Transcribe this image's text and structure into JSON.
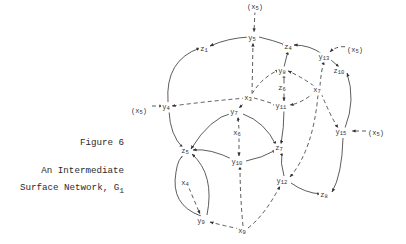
{
  "figure": {
    "number_label": "Figure 6",
    "title_line1": "An Intermediate",
    "title_line2_main": "Surface Network, G",
    "title_line2_sub": "1"
  },
  "nodes": [
    {
      "id": "x5_top",
      "base": "(x",
      "sub": "5",
      "suffix": ")",
      "x": 255,
      "y": 7
    },
    {
      "id": "y5",
      "base": "y",
      "sub": "5",
      "suffix": "",
      "x": 252,
      "y": 38
    },
    {
      "id": "z1",
      "base": "z",
      "sub": "1",
      "suffix": "",
      "x": 204,
      "y": 49
    },
    {
      "id": "z4",
      "base": "z",
      "sub": "4",
      "suffix": "",
      "x": 288,
      "y": 47
    },
    {
      "id": "y13",
      "base": "y",
      "sub": "13",
      "suffix": "",
      "x": 324,
      "y": 57
    },
    {
      "id": "x5_rt",
      "base": "(x",
      "sub": "5",
      "suffix": ")",
      "x": 355,
      "y": 50
    },
    {
      "id": "z10",
      "base": "z",
      "sub": "10",
      "suffix": "",
      "x": 339,
      "y": 71
    },
    {
      "id": "y8",
      "base": "y",
      "sub": "8",
      "suffix": "",
      "x": 282,
      "y": 71
    },
    {
      "id": "z6",
      "base": "z",
      "sub": "6",
      "suffix": "",
      "x": 282,
      "y": 88
    },
    {
      "id": "x7",
      "base": "x",
      "sub": "7",
      "suffix": "",
      "x": 317,
      "y": 90
    },
    {
      "id": "x3",
      "base": "x",
      "sub": "3",
      "suffix": "",
      "x": 248,
      "y": 98
    },
    {
      "id": "y11",
      "base": "y",
      "sub": "11",
      "suffix": "",
      "x": 281,
      "y": 106
    },
    {
      "id": "x5_left",
      "base": "(x",
      "sub": "5",
      "suffix": ")",
      "x": 139,
      "y": 111
    },
    {
      "id": "y4",
      "base": "y",
      "sub": "4",
      "suffix": "",
      "x": 166,
      "y": 107
    },
    {
      "id": "y7",
      "base": "y",
      "sub": "7",
      "suffix": "",
      "x": 234,
      "y": 112
    },
    {
      "id": "x6",
      "base": "x",
      "sub": "6",
      "suffix": "",
      "x": 237,
      "y": 133
    },
    {
      "id": "y15",
      "base": "y",
      "sub": "15",
      "suffix": "",
      "x": 341,
      "y": 132
    },
    {
      "id": "x5_rt2",
      "base": "(x",
      "sub": "5",
      "suffix": ")",
      "x": 376,
      "y": 133
    },
    {
      "id": "z5",
      "base": "z",
      "sub": "5",
      "suffix": "",
      "x": 185,
      "y": 151
    },
    {
      "id": "z7",
      "base": "z",
      "sub": "7",
      "suffix": "",
      "x": 279,
      "y": 148
    },
    {
      "id": "y10",
      "base": "y",
      "sub": "10",
      "suffix": "",
      "x": 237,
      "y": 162
    },
    {
      "id": "y12",
      "base": "y",
      "sub": "12",
      "suffix": "",
      "x": 282,
      "y": 181
    },
    {
      "id": "z8",
      "base": "z",
      "sub": "8",
      "suffix": "",
      "x": 324,
      "y": 195
    },
    {
      "id": "x4",
      "base": "x",
      "sub": "4",
      "suffix": "",
      "x": 185,
      "y": 183
    },
    {
      "id": "y9",
      "base": "y",
      "sub": "9",
      "suffix": "",
      "x": 201,
      "y": 221
    },
    {
      "id": "x9",
      "base": "x",
      "sub": "9",
      "suffix": "",
      "x": 242,
      "y": 231
    }
  ],
  "edges": [
    {
      "from": "x5_top",
      "to": "y5",
      "style": "dashed",
      "path": "M255,11 L254,32"
    },
    {
      "from": "y5",
      "to": "z1",
      "style": "solid",
      "path": "M249,37 Q228,38 210,46"
    },
    {
      "from": "y5",
      "to": "z4",
      "style": "solid",
      "path": "M259,37 Q272,40 286,45"
    },
    {
      "from": "y13",
      "to": "z4",
      "style": "solid",
      "path": "M322,54 Q310,45 294,45"
    },
    {
      "from": "x5_rt",
      "to": "y13",
      "style": "dashed",
      "path": "M352,48 Q338,44 330,52"
    },
    {
      "from": "y13",
      "to": "z10",
      "style": "solid",
      "path": "M331,60 L339,67"
    },
    {
      "from": "y15",
      "to": "z10",
      "style": "solid",
      "path": "M345,128 Q356,100 347,73"
    },
    {
      "from": "x5_rt2",
      "to": "y15",
      "style": "dashed",
      "path": "M373,131 L352,131"
    },
    {
      "from": "y15",
      "to": "z8",
      "style": "solid",
      "path": "M343,138 Q342,175 332,192"
    },
    {
      "from": "y12",
      "to": "z8",
      "style": "solid",
      "path": "M291,183 Q305,193 321,194"
    },
    {
      "from": "x7",
      "to": "y13",
      "style": "dashed",
      "path": "M320,86 Q321,72 324,61"
    },
    {
      "from": "x7",
      "to": "y15",
      "style": "dashed",
      "path": "M321,93 Q330,115 338,128"
    },
    {
      "from": "x7",
      "to": "y12",
      "style": "dashed",
      "path": "M318,95 Q313,150 290,177"
    },
    {
      "from": "x7",
      "to": "y8",
      "style": "dashed",
      "path": "M314,86 Q300,76 288,71"
    },
    {
      "from": "x7",
      "to": "y11",
      "style": "dashed",
      "path": "M315,92 Q302,103 290,105"
    },
    {
      "from": "y8",
      "to": "z4",
      "style": "solid",
      "path": "M284,67 L288,51"
    },
    {
      "from": "z6",
      "to": "y8",
      "style": "solid",
      "path": "M284,84 L284,74"
    },
    {
      "from": "z6",
      "to": "y11",
      "style": "solid",
      "path": "M284,91 L284,101"
    },
    {
      "from": "y11",
      "to": "z7",
      "style": "solid",
      "path": "M284,110 Q284,128 281,144"
    },
    {
      "from": "y12",
      "to": "z7",
      "style": "solid",
      "path": "M284,176 Q280,163 282,152"
    },
    {
      "from": "x3",
      "to": "y5",
      "style": "dashed",
      "path": "M252,94 L253,43"
    },
    {
      "from": "x3",
      "to": "y8",
      "style": "dashed",
      "path": "M252,94 Q262,77 279,70"
    },
    {
      "from": "x3",
      "to": "y4",
      "style": "dashed",
      "path": "M246,98 Q210,101 172,106"
    },
    {
      "from": "x3",
      "to": "y11",
      "style": "dashed",
      "path": "M254,98 Q265,101 277,105"
    },
    {
      "from": "x3",
      "to": "y7",
      "style": "dashed",
      "path": "M248,100 L239,108"
    },
    {
      "from": "x5_left",
      "to": "y4",
      "style": "dashed",
      "path": "M152,106 L163,106"
    },
    {
      "from": "y4",
      "to": "z1",
      "style": "solid",
      "path": "M168,102 Q165,60 200,48"
    },
    {
      "from": "y4",
      "to": "z5",
      "style": "solid",
      "path": "M169,111 Q170,135 183,148"
    },
    {
      "from": "y7",
      "to": "z5",
      "style": "solid",
      "path": "M232,113 Q210,118 191,149"
    },
    {
      "from": "y7",
      "to": "z7",
      "style": "solid",
      "path": "M243,114 Q265,122 276,145"
    },
    {
      "from": "x6",
      "to": "y7",
      "style": "dashed",
      "path": "M239,129 L238,117"
    },
    {
      "from": "x6",
      "to": "y10",
      "style": "dashed",
      "path": "M239,138 L239,156"
    },
    {
      "from": "y10",
      "to": "z5",
      "style": "solid",
      "path": "M234,160 Q210,148 193,150"
    },
    {
      "from": "y10",
      "to": "z7",
      "style": "solid",
      "path": "M246,161 Q262,158 276,150"
    },
    {
      "from": "x9",
      "to": "y10",
      "style": "dashed",
      "path": "M243,226 Q240,195 240,166"
    },
    {
      "from": "x9",
      "to": "y9",
      "style": "dashed",
      "path": "M240,229 Q225,226 210,222"
    },
    {
      "from": "x9",
      "to": "y12",
      "style": "dashed",
      "path": "M248,228 Q265,215 280,186"
    },
    {
      "from": "x4",
      "to": "y9",
      "style": "dashed",
      "path": "M189,188 L200,214"
    },
    {
      "from": "y9",
      "to": "z5",
      "style": "solid",
      "path": "M201,216 Q170,205 176,172 Q178,158 184,155"
    },
    {
      "from": "y9",
      "to": "z5",
      "style": "solid",
      "path": "M207,215 Q215,175 192,154"
    }
  ]
}
